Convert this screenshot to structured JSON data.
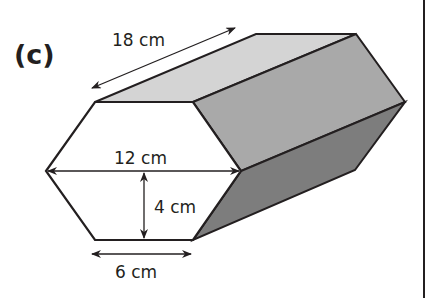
{
  "part_label": "(c)",
  "shape": "hexagonal prism",
  "dimensions": {
    "length": "18 cm",
    "width": "12 cm",
    "height": "4 cm",
    "edge": "6 cm"
  },
  "colors": {
    "top_face": "#d4d4d4",
    "side_face": "#a9a9a9",
    "bottom_face": "#7d7d7d",
    "front_face": "#ffffff",
    "outline": "#231f20"
  }
}
